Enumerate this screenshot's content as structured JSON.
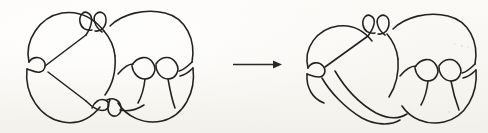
{
  "figure": {
    "title": "Knot diagram isotopy",
    "description": "Two hand-drawn knot diagrams connected by a rightward arrow",
    "background_color": "#f7f6f2",
    "ink_color": "#23211f",
    "width": 488,
    "height": 133
  },
  "left_diagram": {
    "name": "Knot diagram before move",
    "label": "",
    "crossing_count": "8",
    "bounds": {
      "x": 18,
      "y": 8,
      "width": 190,
      "height": 118
    }
  },
  "arrow": {
    "name": "transformation-arrow",
    "direction": "right",
    "label": "",
    "color": "#2a2826",
    "x_start": 233,
    "x_end": 281,
    "y": 64
  },
  "right_diagram": {
    "name": "Knot diagram after move",
    "label": "",
    "crossing_count": "8",
    "bounds": {
      "x": 300,
      "y": 12,
      "width": 180,
      "height": 116
    }
  }
}
